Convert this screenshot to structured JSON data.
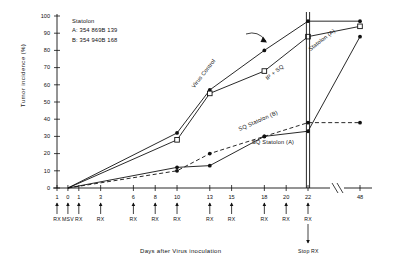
{
  "chart_data": {
    "type": "line",
    "title": "",
    "xlabel": "Days after Virus inoculation",
    "ylabel": "Tumor incidence (%)",
    "xlim": [
      -1,
      48
    ],
    "ylim": [
      0,
      100
    ],
    "grid": false,
    "legend_position": "upper-left-inset",
    "x_ticks": [
      "1",
      "0",
      "1",
      "3",
      "6",
      "8",
      "10",
      "13",
      "15",
      "18",
      "20",
      "22",
      "48"
    ],
    "x_tick_values": [
      -1,
      0,
      1,
      3,
      6,
      8,
      10,
      13,
      15,
      18,
      20,
      22,
      48
    ],
    "y_ticks": [
      "0",
      "10",
      "20",
      "30",
      "40",
      "50",
      "60",
      "70",
      "80",
      "90",
      "100"
    ],
    "y_tick_values": [
      0,
      10,
      20,
      30,
      40,
      50,
      60,
      70,
      80,
      90,
      100
    ],
    "axis_break_after": 22,
    "treatment_arrows": [
      {
        "x": -1,
        "label": "RX"
      },
      {
        "x": 0,
        "label": "MSV"
      },
      {
        "x": 1,
        "label": "RX"
      },
      {
        "x": 3,
        "label": "RX"
      },
      {
        "x": 6,
        "label": "RX"
      },
      {
        "x": 8,
        "label": "RX"
      },
      {
        "x": 10,
        "label": "RX"
      },
      {
        "x": 13,
        "label": "RX"
      },
      {
        "x": 15,
        "label": "RX"
      },
      {
        "x": 18,
        "label": "RX"
      },
      {
        "x": 20,
        "label": "RX"
      },
      {
        "x": 22,
        "label": "RX"
      }
    ],
    "stop_rx_label": "Stop RX",
    "stop_rx_x": 22,
    "series": [
      {
        "name": "Virus Control",
        "marker": "filled-circle",
        "line": "solid",
        "x": [
          0,
          10,
          13,
          18,
          22,
          48
        ],
        "values": [
          0,
          32,
          57,
          80,
          97,
          97
        ]
      },
      {
        "name": "IP + SQ Statolon (A)",
        "marker": "open-square",
        "line": "solid",
        "x": [
          0,
          10,
          13,
          18,
          22,
          48
        ],
        "values": [
          0,
          28,
          55,
          68,
          88,
          94
        ]
      },
      {
        "name": "SQ Statolon (B)",
        "marker": "filled-circle",
        "line": "solid",
        "x": [
          0,
          10,
          13,
          18,
          22,
          48
        ],
        "values": [
          0,
          12,
          13,
          30,
          33,
          88
        ]
      },
      {
        "name": "SQ Statolon (A)",
        "marker": "filled-circle",
        "line": "dashed",
        "x": [
          0,
          10,
          13,
          18,
          22,
          48
        ],
        "values": [
          0,
          10,
          20,
          30,
          38,
          38
        ]
      }
    ],
    "annotations": [
      {
        "text": "Virus Control",
        "kind": "curve-label-rotated"
      },
      {
        "text": "IP + SQ",
        "kind": "curve-label-rotated"
      },
      {
        "text": "Statolon (A)",
        "kind": "curve-label-rotated"
      },
      {
        "text": "SQ Statolon (B)",
        "kind": "curve-label-rotated"
      },
      {
        "text": "SQ  Statolon (A)",
        "kind": "curve-label"
      }
    ]
  },
  "legend": {
    "title": "Statolon",
    "line_a": "A: 354 869B 139",
    "line_b": "B: 354 940B 168"
  },
  "labels": {
    "y_axis": "Tumor incidence  (%)",
    "x_axis": "Days after Virus inoculation",
    "stop_rx": "Stop RX",
    "virus_control": "Virus Control",
    "ip_sq": "IP + SQ",
    "statolon_a_top": "Statolon (A)",
    "sq_statolon_b": "SQ Statolon (B)",
    "sq_statolon_a": "SQ  Statolon (A)"
  },
  "ticks": {
    "y": [
      "100",
      "90",
      "80",
      "70",
      "60",
      "50",
      "40",
      "30",
      "20",
      "10",
      "0"
    ],
    "x": [
      "1",
      "0",
      "1",
      "3",
      "6",
      "8",
      "10",
      "13",
      "15",
      "18",
      "20",
      "22",
      "48"
    ],
    "rx": [
      "RX",
      "MSV",
      "RX",
      "RX",
      "RX",
      "RX",
      "RX",
      "RX",
      "RX",
      "RX",
      "RX",
      "RX"
    ]
  },
  "colors": {
    "ink": "#1a1a1a",
    "background": "#ffffff"
  }
}
